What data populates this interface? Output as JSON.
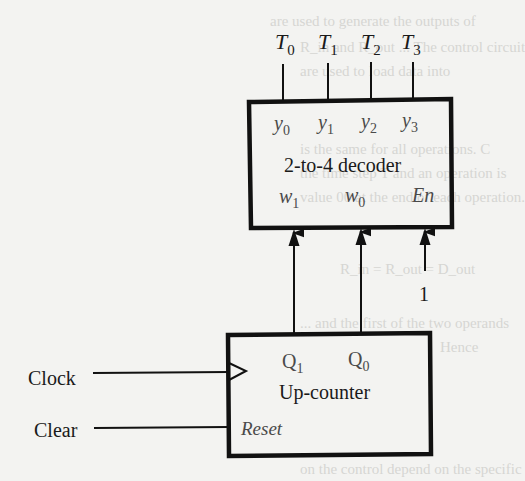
{
  "diagram": {
    "decoder": {
      "label": "2-to-4 decoder",
      "outputs": [
        {
          "pin": "y",
          "sub": "0",
          "signal": "T",
          "signal_sub": "0"
        },
        {
          "pin": "y",
          "sub": "1",
          "signal": "T",
          "signal_sub": "1"
        },
        {
          "pin": "y",
          "sub": "2",
          "signal": "T",
          "signal_sub": "2"
        },
        {
          "pin": "y",
          "sub": "3",
          "signal": "T",
          "signal_sub": "3"
        }
      ],
      "inputs": [
        {
          "pin": "w",
          "sub": "1"
        },
        {
          "pin": "w",
          "sub": "0"
        }
      ],
      "enable": {
        "pin": "En",
        "value": "1"
      }
    },
    "counter": {
      "label": "Up-counter",
      "outputs": [
        {
          "pin": "Q",
          "sub": "1"
        },
        {
          "pin": "Q",
          "sub": "0"
        }
      ],
      "reset_pin": "Reset",
      "clock_symbol": "triangle"
    },
    "inputs": {
      "clock": "Clock",
      "clear": "Clear"
    },
    "connections": [
      {
        "from": "counter.Q1",
        "to": "decoder.w1"
      },
      {
        "from": "counter.Q0",
        "to": "decoder.w0"
      },
      {
        "from": "constant 1",
        "to": "decoder.En"
      },
      {
        "from": "Clock",
        "to": "counter.clock"
      },
      {
        "from": "Clear",
        "to": "counter.Reset"
      }
    ]
  },
  "background_bleed": [
    "are used to generate the outputs of",
    "R_in and R_out ... The control circuit",
    "are used to load data into",
    "is the same for all operations. C",
    "the time step T and an operation is",
    "value 00 at the end of each operation.",
    "R_in = R_out = D_out",
    "... and the first of the two operands",
    "Hence",
    "on the control depend on the specific"
  ]
}
